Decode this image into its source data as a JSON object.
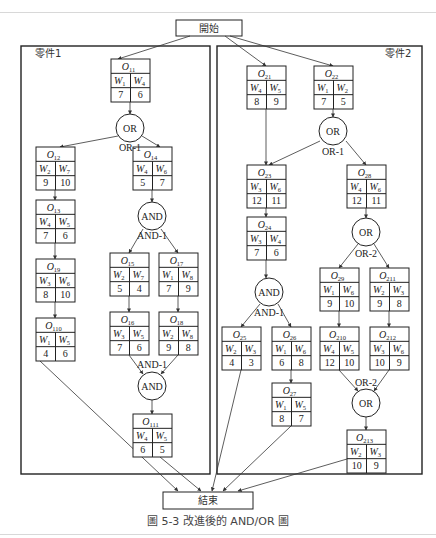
{
  "diagram": {
    "start_label": "開始",
    "end_label": "結束",
    "caption": "圖 5-3   改進後的 AND/OR 圖",
    "parts": [
      {
        "label": "零件1"
      },
      {
        "label": "零件2"
      }
    ],
    "nodes": [
      {
        "id": "O11",
        "base": "O",
        "sub": "11",
        "x": 111,
        "y": 59,
        "w": [
          [
            "W",
            "1"
          ],
          [
            "W",
            "4"
          ]
        ],
        "v": [
          "7",
          "6"
        ]
      },
      {
        "id": "O12",
        "base": "O",
        "sub": "12",
        "x": 36,
        "y": 147,
        "w": [
          [
            "W",
            "2"
          ],
          [
            "W",
            "7"
          ]
        ],
        "v": [
          "9",
          "10"
        ]
      },
      {
        "id": "O14",
        "base": "O",
        "sub": "14",
        "x": 133,
        "y": 147,
        "w": [
          [
            "W",
            "4"
          ],
          [
            "W",
            "6"
          ]
        ],
        "v": [
          "5",
          "7"
        ]
      },
      {
        "id": "O13",
        "base": "O",
        "sub": "13",
        "x": 36,
        "y": 200,
        "w": [
          [
            "W",
            "4"
          ],
          [
            "W",
            "5"
          ]
        ],
        "v": [
          "7",
          "6"
        ]
      },
      {
        "id": "O19",
        "base": "O",
        "sub": "19",
        "x": 36,
        "y": 259,
        "w": [
          [
            "W",
            "3"
          ],
          [
            "W",
            "6"
          ]
        ],
        "v": [
          "8",
          "10"
        ]
      },
      {
        "id": "O15",
        "base": "O",
        "sub": "15",
        "x": 110,
        "y": 253,
        "w": [
          [
            "W",
            "2"
          ],
          [
            "W",
            "7"
          ]
        ],
        "v": [
          "5",
          "4"
        ]
      },
      {
        "id": "O17",
        "base": "O",
        "sub": "17",
        "x": 159,
        "y": 253,
        "w": [
          [
            "W",
            "1"
          ],
          [
            "W",
            "8"
          ]
        ],
        "v": [
          "7",
          "9"
        ]
      },
      {
        "id": "O110",
        "base": "O",
        "sub": "110",
        "x": 36,
        "y": 318,
        "w": [
          [
            "W",
            "1"
          ],
          [
            "W",
            "5"
          ]
        ],
        "v": [
          "4",
          "6"
        ]
      },
      {
        "id": "O16",
        "base": "O",
        "sub": "16",
        "x": 110,
        "y": 312,
        "w": [
          [
            "W",
            "3"
          ],
          [
            "W",
            "5"
          ]
        ],
        "v": [
          "7",
          "6"
        ]
      },
      {
        "id": "O18",
        "base": "O",
        "sub": "18",
        "x": 159,
        "y": 312,
        "w": [
          [
            "W",
            "2"
          ],
          [
            "W",
            "8"
          ]
        ],
        "v": [
          "9",
          "8"
        ]
      },
      {
        "id": "O111",
        "base": "O",
        "sub": "111",
        "x": 133,
        "y": 414,
        "w": [
          [
            "W",
            "4"
          ],
          [
            "W",
            "5"
          ]
        ],
        "v": [
          "6",
          "5"
        ]
      },
      {
        "id": "O21",
        "base": "O",
        "sub": "21",
        "x": 247,
        "y": 66,
        "w": [
          [
            "W",
            "4"
          ],
          [
            "W",
            "5"
          ]
        ],
        "v": [
          "8",
          "9"
        ]
      },
      {
        "id": "O22",
        "base": "O",
        "sub": "22",
        "x": 314,
        "y": 66,
        "w": [
          [
            "W",
            "1"
          ],
          [
            "W",
            "2"
          ]
        ],
        "v": [
          "7",
          "5"
        ]
      },
      {
        "id": "O23",
        "base": "O",
        "sub": "23",
        "x": 247,
        "y": 165,
        "w": [
          [
            "W",
            "3"
          ],
          [
            "W",
            "6"
          ]
        ],
        "v": [
          "12",
          "11"
        ]
      },
      {
        "id": "O28",
        "base": "O",
        "sub": "28",
        "x": 347,
        "y": 165,
        "w": [
          [
            "W",
            "4"
          ],
          [
            "W",
            "6"
          ]
        ],
        "v": [
          "12",
          "11"
        ]
      },
      {
        "id": "O24",
        "base": "O",
        "sub": "24",
        "x": 247,
        "y": 217,
        "w": [
          [
            "W",
            "3"
          ],
          [
            "W",
            "4"
          ]
        ],
        "v": [
          "7",
          "6"
        ]
      },
      {
        "id": "O29",
        "base": "O",
        "sub": "29",
        "x": 320,
        "y": 268,
        "w": [
          [
            "W",
            "1"
          ],
          [
            "W",
            "6"
          ]
        ],
        "v": [
          "9",
          "10"
        ]
      },
      {
        "id": "O211",
        "base": "O",
        "sub": "211",
        "x": 370,
        "y": 268,
        "w": [
          [
            "W",
            "2"
          ],
          [
            "W",
            "3"
          ]
        ],
        "v": [
          "9",
          "8"
        ]
      },
      {
        "id": "O25",
        "base": "O",
        "sub": "25",
        "x": 222,
        "y": 327,
        "w": [
          [
            "W",
            "2"
          ],
          [
            "W",
            "3"
          ]
        ],
        "v": [
          "4",
          "3"
        ]
      },
      {
        "id": "O26",
        "base": "O",
        "sub": "26",
        "x": 272,
        "y": 327,
        "w": [
          [
            "W",
            "1"
          ],
          [
            "W",
            "6"
          ]
        ],
        "v": [
          "6",
          "8"
        ]
      },
      {
        "id": "O210",
        "base": "O",
        "sub": "210",
        "x": 320,
        "y": 327,
        "w": [
          [
            "W",
            "4"
          ],
          [
            "W",
            "5"
          ]
        ],
        "v": [
          "12",
          "10"
        ]
      },
      {
        "id": "O212",
        "base": "O",
        "sub": "212",
        "x": 370,
        "y": 327,
        "w": [
          [
            "W",
            "3"
          ],
          [
            "W",
            "6"
          ]
        ],
        "v": [
          "10",
          "9"
        ]
      },
      {
        "id": "O27",
        "base": "O",
        "sub": "27",
        "x": 272,
        "y": 383,
        "w": [
          [
            "W",
            "1"
          ],
          [
            "W",
            "5"
          ]
        ],
        "v": [
          "8",
          "7"
        ]
      },
      {
        "id": "O213",
        "base": "O",
        "sub": "213",
        "x": 347,
        "y": 430,
        "w": [
          [
            "W",
            "2"
          ],
          [
            "W",
            "3"
          ]
        ],
        "v": [
          "10",
          "9"
        ]
      }
    ],
    "gates": [
      {
        "id": "g1",
        "type": "OR",
        "x": 130,
        "y": 128,
        "label": "OR-1",
        "lx": 130,
        "ly": 147
      },
      {
        "id": "g2",
        "type": "AND",
        "x": 152,
        "y": 216,
        "label": "AND-1",
        "lx": 152,
        "ly": 235
      },
      {
        "id": "g3",
        "type": "AND",
        "x": 152,
        "y": 386,
        "label": "AND-1",
        "lx": 152,
        "ly": 364
      },
      {
        "id": "g4",
        "type": "OR",
        "x": 333,
        "y": 131,
        "label": "OR-1",
        "lx": 333,
        "ly": 151
      },
      {
        "id": "g5",
        "type": "OR",
        "x": 366,
        "y": 232,
        "label": "OR-2",
        "lx": 366,
        "ly": 253
      },
      {
        "id": "g6",
        "type": "AND",
        "x": 269,
        "y": 292,
        "label": "AND-1",
        "lx": 269,
        "ly": 312
      },
      {
        "id": "g7",
        "type": "OR",
        "x": 366,
        "y": 403,
        "label": "OR-2",
        "lx": 366,
        "ly": 382
      }
    ]
  }
}
